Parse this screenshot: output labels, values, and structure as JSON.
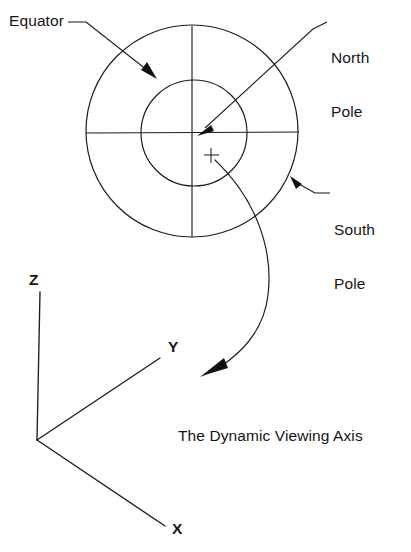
{
  "figure": {
    "caption": "The Dynamic Viewing Axis"
  },
  "callouts": {
    "equator": "Equator",
    "north_pole_line1": "North",
    "north_pole_line2": "Pole",
    "south_pole_line1": "South",
    "south_pole_line2": "Pole"
  },
  "axes": {
    "z_label": "Z",
    "y_label": "Y",
    "x_label": "X"
  },
  "icons": {
    "center_marker": "plus-crosshair-icon",
    "equator_arrow": "arrow-pointer-icon",
    "north_pole_arrow": "arrow-pointer-icon",
    "south_pole_arrow": "arrow-pointer-icon",
    "viewing_axis_arrow": "curved-arrow-icon"
  },
  "colors": {
    "stroke": "#1d1d1d",
    "text": "#161616",
    "background": "#ffffff"
  },
  "geometry": {
    "outer_circle": {
      "cx": 192,
      "cy": 131,
      "r": 106
    },
    "inner_circle": {
      "cx": 194,
      "cy": 133,
      "r": 53
    },
    "center_marker": {
      "x": 211,
      "y": 155
    },
    "axis_origin": {
      "x": 37,
      "y": 440
    },
    "z_axis_end": {
      "x": 40,
      "y": 292
    },
    "y_axis_end": {
      "x": 160,
      "y": 358
    },
    "x_axis_end": {
      "x": 165,
      "y": 526
    }
  }
}
